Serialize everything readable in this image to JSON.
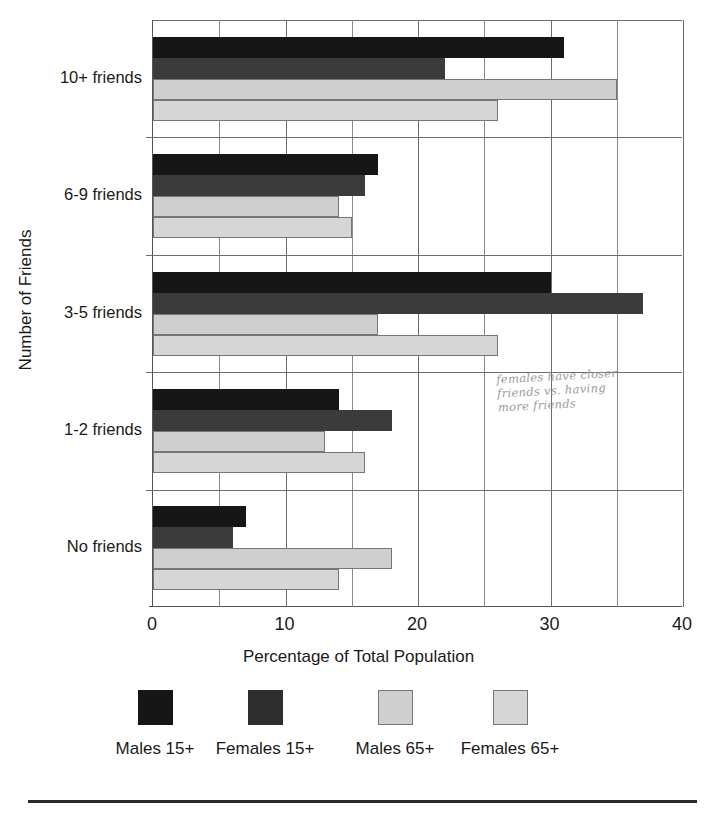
{
  "chart_data": {
    "type": "bar",
    "orientation": "horizontal",
    "title": "",
    "xlabel": "Percentage of Total Population",
    "ylabel": "Number of Friends",
    "xlim": [
      0,
      40
    ],
    "xticks": [
      0,
      10,
      20,
      30,
      40
    ],
    "xtick_labels": [
      "0",
      "10",
      "20",
      "30",
      "40"
    ],
    "minor_gridlines": [
      5,
      15,
      25,
      35
    ],
    "grid": true,
    "legend_position": "bottom",
    "categories": [
      "No friends",
      "1-2 friends",
      "3-5 friends",
      "6-9 friends",
      "10+ friends"
    ],
    "categories_top_to_bottom": [
      "10+ friends",
      "6-9 friends",
      "3-5 friends",
      "1-2 friends",
      "No friends"
    ],
    "series": [
      {
        "name": "Males 15+",
        "color": "#161616",
        "values": [
          7,
          14,
          30,
          17,
          31
        ]
      },
      {
        "name": "Females 15+",
        "color": "#3b3b3b",
        "values": [
          6,
          18,
          37,
          16,
          22
        ]
      },
      {
        "name": "Males 65+",
        "color": "#cfcfcf",
        "values": [
          18,
          13,
          17,
          14,
          35
        ]
      },
      {
        "name": "Females 65+",
        "color": "#d6d6d6",
        "values": [
          14,
          16,
          26,
          15,
          26
        ]
      }
    ]
  },
  "annotation": {
    "handwritten_note": "females have closer\nfriends vs. having\nmore friends"
  },
  "legend": {
    "items": [
      {
        "label": "Males 15+",
        "color": "#161616"
      },
      {
        "label": "Females 15+",
        "color": "#2e2e2e"
      },
      {
        "label": "Males 65+",
        "color": "#cfcfcf"
      },
      {
        "label": "Females 65+",
        "color": "#d6d6d6"
      }
    ]
  }
}
